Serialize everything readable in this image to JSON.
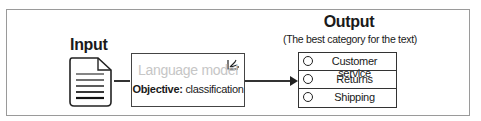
{
  "diagram": {
    "input": {
      "label": "Input",
      "icon": "document-icon"
    },
    "model": {
      "title": "Language model",
      "objective_label": "Objective:",
      "objective_value": "classification",
      "icon": "sparkle-icon"
    },
    "output": {
      "title": "Output",
      "subtitle": "(The best category for the text)",
      "options": [
        {
          "label": "Customer service"
        },
        {
          "label": "Returns"
        },
        {
          "label": "Shipping"
        }
      ]
    }
  }
}
